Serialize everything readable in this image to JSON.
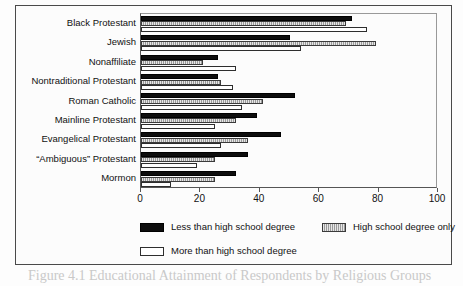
{
  "chart_data": {
    "type": "bar",
    "orientation": "horizontal",
    "title": "",
    "xlabel": "",
    "ylabel": "",
    "xlim": [
      0,
      100
    ],
    "xticks": [
      0,
      20,
      40,
      60,
      80,
      100
    ],
    "grid": false,
    "legend_position": "bottom",
    "categories": [
      "Black Protestant",
      "Jewish",
      "Nonaffiliate",
      "Nontraditional Protestant",
      "Roman Catholic",
      "Mainline Protestant",
      "Evangelical Protestant",
      "“Ambiguous” Protestant",
      "Mormon"
    ],
    "series": [
      {
        "name": "Less than high school degree",
        "fill": "black",
        "values": [
          71,
          50,
          26,
          26,
          52,
          39,
          47,
          36,
          32
        ]
      },
      {
        "name": "High school degree only",
        "fill": "hatched-gray",
        "values": [
          69,
          79,
          21,
          27,
          41,
          32,
          36,
          25,
          25
        ]
      },
      {
        "name": "More than high school degree",
        "fill": "white",
        "values": [
          76,
          54,
          32,
          31,
          34,
          25,
          27,
          19,
          10
        ]
      }
    ]
  },
  "axis": {
    "tick_labels": [
      "0",
      "20",
      "40",
      "60",
      "80",
      "100"
    ]
  },
  "legend": {
    "items": [
      {
        "label": "Less than high school degree",
        "swatch": "black-swatch"
      },
      {
        "label": "High school degree only",
        "swatch": "hatched-swatch"
      },
      {
        "label": "More than high school degree",
        "swatch": "white-swatch"
      }
    ]
  },
  "caption": {
    "text": "Figure 4.1  Educational Attainment of Respondents by Religious Groups"
  },
  "colors": {
    "less": "#0d0d0d",
    "only": "#9a9a9a",
    "more": "#ffffff",
    "frame": "#4a4a4a",
    "text": "#111111"
  }
}
